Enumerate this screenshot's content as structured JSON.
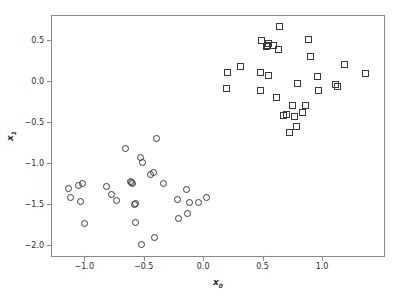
{
  "chart_data": {
    "type": "scatter",
    "title": "",
    "xlabel": "x₀",
    "ylabel": "x₁",
    "xlabel_base": "x",
    "xlabel_sub": "0",
    "ylabel_base": "x",
    "ylabel_sub": "1",
    "xlim": [
      -1.28,
      1.53
    ],
    "ylim": [
      -2.14,
      0.8
    ],
    "grid": false,
    "legend": null,
    "xticks": [
      -1.0,
      -0.5,
      0.0,
      0.5,
      1.0
    ],
    "xticklabels": [
      "−1.0",
      "−0.5",
      "0.0",
      "0.5",
      "1.0"
    ],
    "yticks": [
      0.5,
      0.0,
      -0.5,
      -1.0,
      -1.5,
      -2.0
    ],
    "yticklabels": [
      "0.5",
      "0.0",
      "−0.5",
      "−1.0",
      "−1.5",
      "−2.0"
    ],
    "marker_edge_color": "#3a3a3a",
    "marker_face_color": "none",
    "axes_color": "#8a8a8a",
    "background_color": "#ffffff",
    "series": [
      {
        "name": "cluster-0",
        "marker": "o",
        "marker_shape": "circle",
        "points": [
          [
            -1.145,
            -1.3
          ],
          [
            -1.128,
            -1.4
          ],
          [
            -1.06,
            -1.255
          ],
          [
            -1.022,
            -1.24
          ],
          [
            -1.04,
            -1.455
          ],
          [
            -1.01,
            -1.715
          ],
          [
            -0.82,
            -1.275
          ],
          [
            -0.78,
            -1.37
          ],
          [
            -0.735,
            -1.44
          ],
          [
            -0.66,
            -0.81
          ],
          [
            -0.62,
            -1.215
          ],
          [
            -0.605,
            -1.23
          ],
          [
            -0.61,
            -1.225
          ],
          [
            -0.59,
            -1.495
          ],
          [
            -0.58,
            -1.48
          ],
          [
            -0.575,
            -1.705
          ],
          [
            -0.535,
            -0.915
          ],
          [
            -0.525,
            -1.975
          ],
          [
            -0.52,
            -0.98
          ],
          [
            -0.455,
            -1.125
          ],
          [
            -0.43,
            -1.105
          ],
          [
            -0.42,
            -1.885
          ],
          [
            -0.405,
            -0.69
          ],
          [
            -0.345,
            -1.23
          ],
          [
            -0.222,
            -1.43
          ],
          [
            -0.215,
            -1.665
          ],
          [
            -0.15,
            -1.305
          ],
          [
            -0.14,
            -1.595
          ],
          [
            -0.12,
            -1.46
          ],
          [
            -0.045,
            -1.465
          ],
          [
            0.02,
            -1.4
          ]
        ]
      },
      {
        "name": "cluster-1",
        "marker": "s",
        "marker_shape": "square",
        "points": [
          [
            0.195,
            0.115
          ],
          [
            0.19,
            -0.085
          ],
          [
            0.305,
            0.185
          ],
          [
            0.47,
            0.11
          ],
          [
            0.472,
            -0.1
          ],
          [
            0.485,
            0.505
          ],
          [
            0.525,
            0.435
          ],
          [
            0.53,
            0.445
          ],
          [
            0.54,
            0.465
          ],
          [
            0.545,
            0.08
          ],
          [
            0.58,
            0.44
          ],
          [
            0.61,
            -0.195
          ],
          [
            0.625,
            0.39
          ],
          [
            0.635,
            0.675
          ],
          [
            0.665,
            -0.405
          ],
          [
            0.69,
            -0.4
          ],
          [
            0.715,
            -0.62
          ],
          [
            0.745,
            -0.285
          ],
          [
            0.76,
            -0.415
          ],
          [
            0.775,
            -0.545
          ],
          [
            0.785,
            -0.02
          ],
          [
            0.83,
            -0.375
          ],
          [
            0.855,
            -0.285
          ],
          [
            0.88,
            0.52
          ],
          [
            0.895,
            0.31
          ],
          [
            0.955,
            0.06
          ],
          [
            0.96,
            -0.11
          ],
          [
            1.105,
            -0.035
          ],
          [
            1.125,
            -0.06
          ],
          [
            1.18,
            0.215
          ],
          [
            1.355,
            0.105
          ]
        ]
      }
    ]
  }
}
